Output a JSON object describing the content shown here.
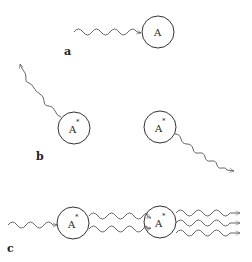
{
  "diagram": {
    "panels": [
      {
        "label": "a",
        "process": "absorption",
        "atoms": [
          {
            "label": "A",
            "excited": false
          }
        ],
        "photons_in": 1,
        "photons_out": 0
      },
      {
        "label": "b",
        "process": "spontaneous emission",
        "atoms": [
          {
            "label": "A",
            "excited": true,
            "superscript": "*"
          },
          {
            "label": "A",
            "excited": true,
            "superscript": "*"
          }
        ],
        "photons_out": 2
      },
      {
        "label": "c",
        "process": "stimulated emission cascade",
        "atoms": [
          {
            "label": "A",
            "excited": true,
            "superscript": "*"
          },
          {
            "label": "A",
            "excited": true,
            "superscript": "*"
          }
        ],
        "photons_in": 1,
        "photons_between": 2,
        "photons_out": 3
      }
    ]
  },
  "labels": {
    "a": "a",
    "b": "b",
    "c": "c",
    "atom": "A",
    "star": "*"
  },
  "colors": {
    "stroke": "#333333",
    "wave": "#555555",
    "background": "#ffffff"
  }
}
